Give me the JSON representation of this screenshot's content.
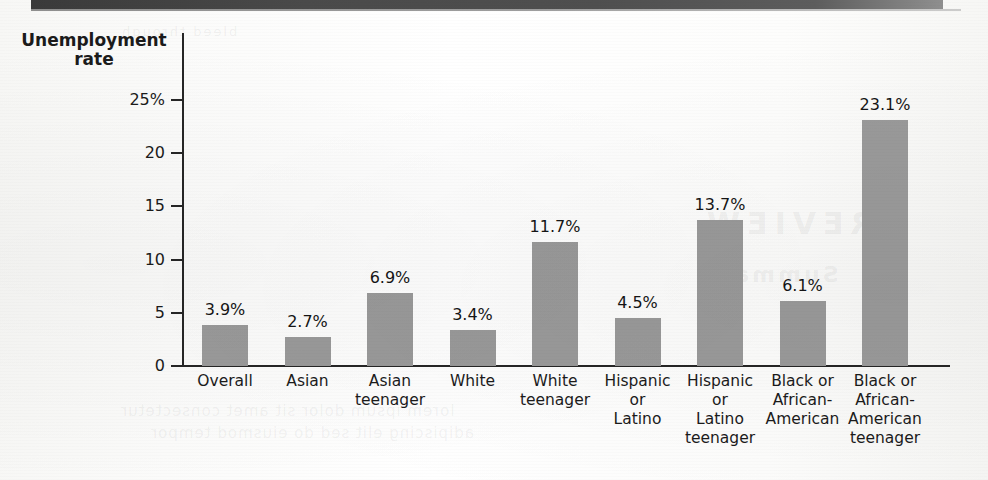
{
  "figure": {
    "y_axis_title_line1": "Unemployment",
    "y_axis_title_line2": "rate"
  },
  "ghost_text": {
    "title": "REVIEW",
    "subtitle": "Summary",
    "line1": "lorem ipsum dolor sit amet consectetur",
    "line2": "adipiscing elit sed do eiusmod tempor",
    "top": "bleed through"
  },
  "chart_data": {
    "type": "bar",
    "title": "",
    "xlabel": "",
    "ylabel": "Unemployment rate",
    "ylim": [
      0,
      26.5
    ],
    "grid": false,
    "legend": "none",
    "bar_color": "#9a9a9a",
    "axis_color": "#262626",
    "ytick_labels": [
      "25%",
      "20",
      "15",
      "10",
      "5",
      "0"
    ],
    "ytick_values": [
      25,
      20,
      15,
      10,
      5,
      0
    ],
    "categories": [
      "Overall",
      "Asian",
      "Asian\nteenager",
      "White",
      "White\nteenager",
      "Hispanic\nor\nLatino",
      "Hispanic\nor\nLatino\nteenager",
      "Black or\nAfrican-\nAmerican",
      "Black or\nAfrican-\nAmerican\nteenager"
    ],
    "category_lines": [
      [
        "Overall"
      ],
      [
        "Asian"
      ],
      [
        "Asian",
        "teenager"
      ],
      [
        "White"
      ],
      [
        "White",
        "teenager"
      ],
      [
        "Hispanic",
        "or",
        "Latino"
      ],
      [
        "Hispanic",
        "or",
        "Latino",
        "teenager"
      ],
      [
        "Black or",
        "African-",
        "American"
      ],
      [
        "Black or",
        "African-",
        "American",
        "teenager"
      ]
    ],
    "values": [
      3.9,
      2.7,
      6.9,
      3.4,
      11.7,
      4.5,
      13.7,
      6.1,
      23.1
    ],
    "value_labels": [
      "3.9%",
      "2.7%",
      "6.9%",
      "3.4%",
      "11.7%",
      "4.5%",
      "13.7%",
      "6.1%",
      "23.1%"
    ]
  }
}
